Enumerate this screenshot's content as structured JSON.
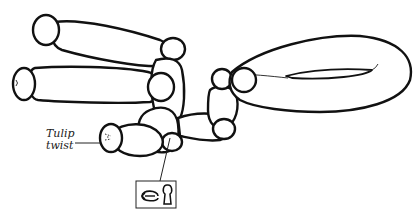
{
  "diagram": {
    "labels": {
      "tulip_line1": "Tulip",
      "tulip_line2": "twist"
    },
    "icon_box": {
      "icons": [
        "rotate-twist-icon",
        "keyhole-lock-icon"
      ]
    },
    "colors": {
      "stroke": "#111111",
      "fill": "#ffffff"
    }
  }
}
